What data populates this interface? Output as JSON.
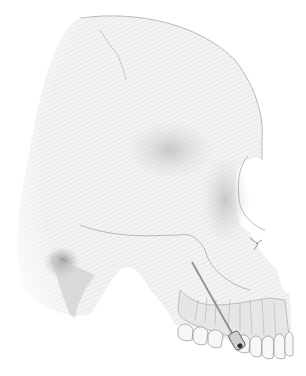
{
  "illustration": {
    "subject": "lateral view of human skull with injection needle at maxilla",
    "background_color": "#ffffff",
    "bone_color": "#f1f1f1",
    "outline_color": "#a8a8a8",
    "shadow_color": "#8a8a8a",
    "needle_color": "#6e6e6e"
  }
}
